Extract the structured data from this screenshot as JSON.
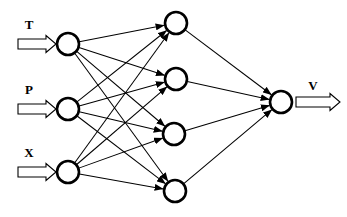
{
  "diagram": {
    "background_color": "#ffffff",
    "stroke_color": "#000000",
    "node_fill_color": "#ffffff",
    "layers": [
      {
        "name": "input-layer",
        "node_count": 3,
        "nodes": [
          {
            "id": "input-1",
            "label": "T",
            "cx": 68,
            "cy": 44,
            "r": 11
          },
          {
            "id": "input-2",
            "label": "P",
            "cx": 68,
            "cy": 109,
            "r": 11
          },
          {
            "id": "input-3",
            "label": "X",
            "cx": 68,
            "cy": 172,
            "r": 11
          }
        ]
      },
      {
        "name": "hidden-layer",
        "node_count": 4,
        "nodes": [
          {
            "id": "hidden-1",
            "label": "",
            "cx": 176,
            "cy": 23,
            "r": 11
          },
          {
            "id": "hidden-2",
            "label": "",
            "cx": 176,
            "cy": 79,
            "r": 11
          },
          {
            "id": "hidden-3",
            "label": "",
            "cx": 174,
            "cy": 134,
            "r": 11
          },
          {
            "id": "hidden-4",
            "label": "",
            "cx": 175,
            "cy": 191,
            "r": 11
          }
        ]
      },
      {
        "name": "output-layer",
        "node_count": 1,
        "nodes": [
          {
            "id": "output-1",
            "label": "V",
            "cx": 281,
            "cy": 102,
            "r": 11
          }
        ]
      }
    ],
    "input_labels": [
      "T",
      "P",
      "X"
    ],
    "output_labels": [
      "V"
    ],
    "input_arrows": [
      {
        "label": "T",
        "label_x": 29,
        "label_y": 29,
        "y": 44
      },
      {
        "label": "P",
        "label_x": 29,
        "label_y": 94,
        "y": 109
      },
      {
        "label": "X",
        "label_x": 29,
        "label_y": 157,
        "y": 172
      }
    ],
    "output_arrow": {
      "label": "V",
      "label_x": 313,
      "label_y": 90,
      "y": 102
    },
    "edge_count_input_hidden": 12,
    "edge_count_hidden_output": 4,
    "connectivity": "fully-connected"
  }
}
